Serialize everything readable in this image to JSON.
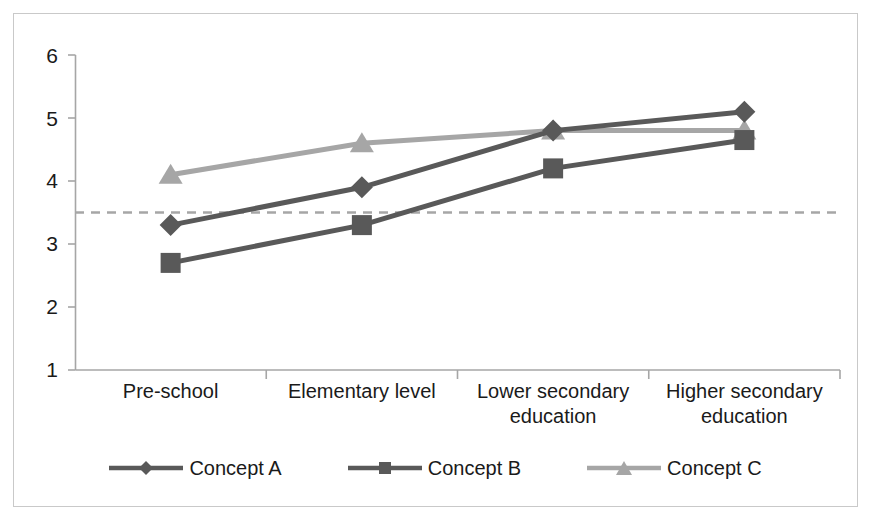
{
  "chart_data": {
    "type": "line",
    "title": "",
    "xlabel": "",
    "ylabel": "",
    "categories": [
      "Pre-school",
      "Elementary level",
      "Lower secondary education",
      "Higher secondary education"
    ],
    "series": [
      {
        "name": "Concept A",
        "marker": "diamond",
        "color": "#595959",
        "values": [
          3.3,
          3.9,
          4.8,
          5.1
        ]
      },
      {
        "name": "Concept B",
        "marker": "square",
        "color": "#595959",
        "values": [
          2.7,
          3.3,
          4.2,
          4.65
        ]
      },
      {
        "name": "Concept C",
        "marker": "triangle",
        "color": "#a6a6a6",
        "values": [
          4.1,
          4.6,
          4.8,
          4.8
        ]
      }
    ],
    "ylim": [
      1,
      6
    ],
    "yticks": [
      1,
      2,
      3,
      4,
      5,
      6
    ],
    "ytick_labels": [
      "1",
      "2",
      "3",
      "4",
      "5",
      "6"
    ],
    "grid": false,
    "legend_position": "bottom",
    "reference_line": {
      "value": 3.5,
      "style": "dashed",
      "color": "#a6a6a6"
    }
  },
  "axis": {
    "y_ticks": [
      "6",
      "5",
      "4",
      "3",
      "2",
      "1"
    ]
  },
  "legend": {
    "items": [
      {
        "label": "Concept A"
      },
      {
        "label": "Concept B"
      },
      {
        "label": "Concept C"
      }
    ]
  },
  "colors": {
    "series_dark": "#595959",
    "series_light": "#a6a6a6",
    "axis": "#a6a6a6",
    "frame": "#c9c9c9",
    "text": "#1a1a1a"
  }
}
